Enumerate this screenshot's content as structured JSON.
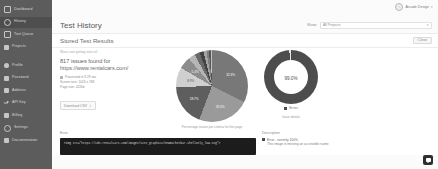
{
  "sidebar": {
    "items": [
      {
        "label": "Dashboard",
        "icon": "grid-icon",
        "active": false
      },
      {
        "label": "History",
        "icon": "clock-icon",
        "active": true
      },
      {
        "label": "Test Queue",
        "icon": "queue-icon",
        "active": false
      },
      {
        "label": "Projects",
        "icon": "folder-icon",
        "active": false
      },
      {
        "label": "Profile",
        "icon": "user-icon",
        "active": false
      },
      {
        "label": "Password",
        "icon": "lock-icon",
        "active": false
      },
      {
        "label": "Address",
        "icon": "home-icon",
        "active": false
      },
      {
        "label": "API Key",
        "icon": "key-icon",
        "active": false
      },
      {
        "label": "Billing",
        "icon": "card-icon",
        "active": false
      },
      {
        "label": "Settings",
        "icon": "gear-icon",
        "active": false
      },
      {
        "label": "Documentation",
        "icon": "book-icon",
        "active": false
      }
    ]
  },
  "topbar": {
    "account_name": "Arcade Design",
    "account_caret": "▾",
    "avatar_glyph": "○"
  },
  "header": {
    "page_title": "Test History",
    "show_label": "Show:",
    "show_value": "All Projects",
    "show_caret": "▾"
  },
  "panel": {
    "title": "Stored Test Results",
    "close_label": "Close",
    "subline": "Wave cant  getting start url.",
    "issues_count_text": "817 issues found for",
    "url": "https://www.rentalcars.com/",
    "meta": [
      "Processed in 9.29 sec",
      "Screen size: 1024 x 768",
      "Page size: 422kb"
    ],
    "download_label": "Download CSV",
    "download_icon": "download-icon"
  },
  "chart_data": [
    {
      "type": "pie",
      "title": "",
      "caption": "Percentage issues per criteria for this page",
      "categories": [
        "1.1.1 Non-text Content",
        "4.1.2 Name, Role, Value",
        "1.4.3 Contrast (Minimum)",
        "2.4.4 Link Purpose",
        "1.3.1 Info and Relationships",
        "3.1.1 Language of Page",
        "2.4.1 Bypass Blocks",
        "1.4.4 Resize Text",
        "2.1.1 Keyboard",
        "4.1.1 Parsing",
        "2.4.6 Headings and Labels",
        "3.3.2 Labels or Instructions"
      ],
      "values": [
        32.3,
        23.5,
        18.7,
        8.9,
        5.4,
        3.1,
        2.4,
        1.8,
        1.4,
        1.1,
        0.8,
        0.6
      ],
      "value_labels": [
        "32.3%",
        "23.5%",
        "18.7%",
        "8.9%",
        "5.4%"
      ],
      "colors": [
        "#787878",
        "#9a9a9a",
        "#5e5e5e",
        "#cfcfcf",
        "#8c8c8c",
        "#b5b5b5",
        "#6a6a6a",
        "#434343",
        "#a4a4a4",
        "#7f7f7f",
        "#555555",
        "#c4c4c4"
      ],
      "legend": "none"
    },
    {
      "type": "pie",
      "title": "",
      "caption": "Issue details",
      "center_value": "99.0%",
      "categories": [
        "Errors",
        "Other"
      ],
      "values": [
        99.0,
        1.0
      ],
      "colors": [
        "#4d4d4d",
        "#e6e6e6"
      ],
      "legend_entries": [
        "Errors"
      ],
      "legend": "bottom"
    }
  ],
  "bottom": {
    "error_label": "Error",
    "description_label": "Description",
    "code": "<img src=\"https://cdn.rentalcars.com/images/site_graphics/newmarketbar-shellonly_low.svg\">",
    "desc_severity": "Error - severity 100%",
    "desc_text": "This image is missing an accessible name",
    "issue_details_label": "Issue details"
  },
  "chat": {
    "icon": "chat-bubble-icon"
  }
}
